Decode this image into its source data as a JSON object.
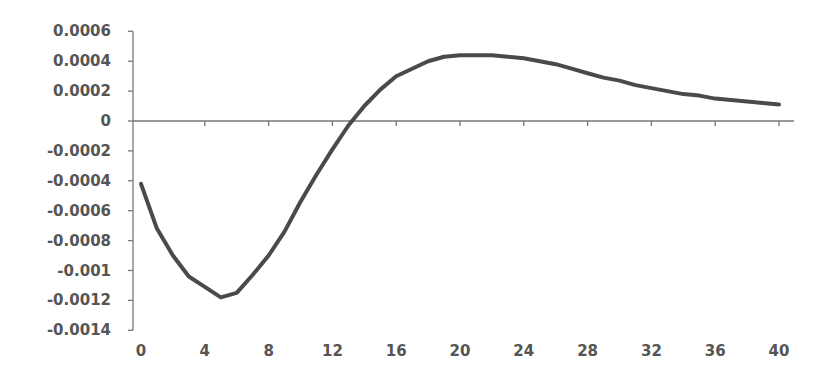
{
  "chart_data": {
    "type": "line",
    "title": "",
    "xlabel": "",
    "ylabel": "",
    "xlim": [
      0,
      40
    ],
    "ylim": [
      -0.0014,
      0.0006
    ],
    "grid": false,
    "legend": null,
    "x_ticks": [
      "0",
      "4",
      "8",
      "12",
      "16",
      "20",
      "24",
      "28",
      "32",
      "36",
      "40"
    ],
    "y_ticks": [
      "0.0006",
      "0.0004",
      "0.0002",
      "0",
      "-0.0002",
      "-0.0004",
      "-0.0006",
      "-0.0008",
      "-0.001",
      "-0.0012",
      "-0.0014"
    ],
    "series": [
      {
        "name": "response",
        "color": "#4a4a4a",
        "x": [
          0,
          1,
          2,
          3,
          4,
          5,
          6,
          7,
          8,
          9,
          10,
          11,
          12,
          13,
          14,
          15,
          16,
          17,
          18,
          19,
          20,
          21,
          22,
          23,
          24,
          25,
          26,
          27,
          28,
          29,
          30,
          31,
          32,
          33,
          34,
          35,
          36,
          37,
          38,
          39,
          40
        ],
        "values": [
          -0.00042,
          -0.00072,
          -0.0009,
          -0.00104,
          -0.00111,
          -0.00118,
          -0.00115,
          -0.00103,
          -0.0009,
          -0.00074,
          -0.00054,
          -0.00036,
          -0.00019,
          -3e-05,
          0.0001,
          0.00021,
          0.0003,
          0.00035,
          0.0004,
          0.00043,
          0.00044,
          0.00044,
          0.00044,
          0.00043,
          0.00042,
          0.0004,
          0.00038,
          0.00035,
          0.00032,
          0.00029,
          0.00027,
          0.00024,
          0.00022,
          0.0002,
          0.00018,
          0.00017,
          0.00015,
          0.00014,
          0.00013,
          0.00012,
          0.00011
        ]
      }
    ]
  }
}
